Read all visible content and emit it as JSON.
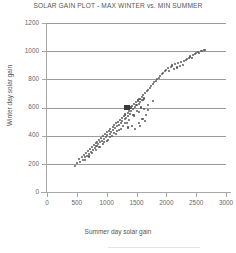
{
  "chart_data": {
    "type": "scatter",
    "title": "SOLAR GAIN PLOT - MAX WINTER vs. MIN SUMMER",
    "xlabel": "Summer day solar gain",
    "ylabel": "Winter day solar gain",
    "xlim": [
      0,
      3000
    ],
    "ylim": [
      0,
      1200
    ],
    "xticks": [
      0,
      500,
      1000,
      1500,
      2000,
      2500,
      3000
    ],
    "yticks": [
      0,
      200,
      400,
      600,
      800,
      1000,
      1200
    ],
    "grid": "horizontal",
    "legend": "none",
    "marker_color": "#5b5b5b",
    "highlight_color": "#3a3a3a",
    "gridline_color": "#9b9b9b",
    "axis_color": "#a8a8a8",
    "series": [
      {
        "name": "days",
        "marker": "small-dot",
        "points": [
          [
            470,
            185
          ],
          [
            505,
            205
          ],
          [
            540,
            232
          ],
          [
            560,
            215
          ],
          [
            585,
            248
          ],
          [
            600,
            228
          ],
          [
            620,
            262
          ],
          [
            640,
            246
          ],
          [
            655,
            278
          ],
          [
            672,
            258
          ],
          [
            690,
            292
          ],
          [
            705,
            272
          ],
          [
            720,
            305
          ],
          [
            738,
            286
          ],
          [
            752,
            318
          ],
          [
            768,
            300
          ],
          [
            782,
            332
          ],
          [
            800,
            312
          ],
          [
            815,
            345
          ],
          [
            830,
            326
          ],
          [
            845,
            358
          ],
          [
            860,
            338
          ],
          [
            875,
            372
          ],
          [
            890,
            352
          ],
          [
            905,
            385
          ],
          [
            920,
            364
          ],
          [
            935,
            398
          ],
          [
            950,
            378
          ],
          [
            962,
            352
          ],
          [
            975,
            410
          ],
          [
            988,
            390
          ],
          [
            1000,
            424
          ],
          [
            1012,
            402
          ],
          [
            1025,
            368
          ],
          [
            1038,
            436
          ],
          [
            1050,
            414
          ],
          [
            1062,
            448
          ],
          [
            1075,
            428
          ],
          [
            1088,
            395
          ],
          [
            1100,
            462
          ],
          [
            1112,
            440
          ],
          [
            1125,
            475
          ],
          [
            1138,
            452
          ],
          [
            1150,
            412
          ],
          [
            1162,
            488
          ],
          [
            1175,
            466
          ],
          [
            1188,
            500
          ],
          [
            1200,
            478
          ],
          [
            1212,
            440
          ],
          [
            1225,
            512
          ],
          [
            1238,
            492
          ],
          [
            1250,
            525
          ],
          [
            1262,
            504
          ],
          [
            1275,
            470
          ],
          [
            1288,
            538
          ],
          [
            1300,
            516
          ],
          [
            1312,
            550
          ],
          [
            1325,
            528
          ],
          [
            1338,
            492
          ],
          [
            1350,
            562
          ],
          [
            1362,
            540
          ],
          [
            1375,
            575
          ],
          [
            1388,
            552
          ],
          [
            1400,
            600
          ],
          [
            1412,
            578
          ],
          [
            1425,
            612
          ],
          [
            1438,
            590
          ],
          [
            1450,
            548
          ],
          [
            1462,
            625
          ],
          [
            1475,
            604
          ],
          [
            1488,
            638
          ],
          [
            1500,
            616
          ],
          [
            1512,
            572
          ],
          [
            1525,
            650
          ],
          [
            1538,
            628
          ],
          [
            1550,
            662
          ],
          [
            1562,
            640
          ],
          [
            1575,
            600
          ],
          [
            1588,
            676
          ],
          [
            1600,
            655
          ],
          [
            1612,
            688
          ],
          [
            1625,
            664
          ],
          [
            1650,
            700
          ],
          [
            1675,
            714
          ],
          [
            1700,
            726
          ],
          [
            1725,
            740
          ],
          [
            1750,
            752
          ],
          [
            1775,
            766
          ],
          [
            1800,
            778
          ],
          [
            1825,
            790
          ],
          [
            1850,
            800
          ],
          [
            1875,
            812
          ],
          [
            1900,
            824
          ],
          [
            1925,
            836
          ],
          [
            1950,
            846
          ],
          [
            1975,
            858
          ],
          [
            2000,
            868
          ],
          [
            2025,
            878
          ],
          [
            2050,
            856
          ],
          [
            2075,
            888
          ],
          [
            2100,
            898
          ],
          [
            2125,
            875
          ],
          [
            2150,
            906
          ],
          [
            2175,
            884
          ],
          [
            2200,
            914
          ],
          [
            2225,
            892
          ],
          [
            2250,
            922
          ],
          [
            2275,
            900
          ],
          [
            2300,
            930
          ],
          [
            2325,
            938
          ],
          [
            2350,
            946
          ],
          [
            2375,
            954
          ],
          [
            2400,
            962
          ],
          [
            2425,
            950
          ],
          [
            2450,
            970
          ],
          [
            2475,
            978
          ],
          [
            2500,
            986
          ],
          [
            2525,
            994
          ],
          [
            2550,
            988
          ],
          [
            2575,
            998
          ],
          [
            2600,
            1002
          ],
          [
            2625,
            1006
          ],
          [
            2650,
            1010
          ],
          [
            1360,
            458
          ],
          [
            1420,
            470
          ],
          [
            1480,
            448
          ],
          [
            1540,
            492
          ],
          [
            1600,
            520
          ],
          [
            1660,
            545
          ],
          [
            1700,
            580
          ],
          [
            1560,
            470
          ],
          [
            1640,
            505
          ],
          [
            1240,
            448
          ],
          [
            1180,
            430
          ],
          [
            1120,
            418
          ],
          [
            1060,
            390
          ],
          [
            1000,
            360
          ],
          [
            940,
            338
          ],
          [
            880,
            318
          ],
          [
            820,
            296
          ],
          [
            760,
            276
          ],
          [
            700,
            252
          ],
          [
            640,
            230
          ],
          [
            1300,
            492
          ],
          [
            1380,
            512
          ],
          [
            1460,
            540
          ],
          [
            1540,
            565
          ],
          [
            1620,
            590
          ],
          [
            1700,
            618
          ],
          [
            1780,
            648
          ]
        ]
      },
      {
        "name": "selected-day",
        "marker": "large-square",
        "points": [
          [
            1340,
            600
          ]
        ]
      }
    ]
  }
}
